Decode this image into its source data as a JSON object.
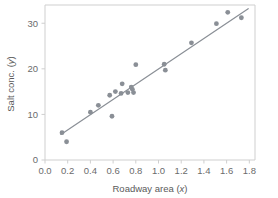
{
  "chart_data": {
    "type": "scatter",
    "title": "",
    "subtitle": "",
    "xlabel": "Roadway area (x)",
    "xlabel_main": "Roadway area",
    "xlabel_var": "x",
    "ylabel": "Salt conc. (y)",
    "ylabel_main": "Salt conc.",
    "ylabel_var": "y",
    "xlim": [
      0.0,
      1.85
    ],
    "ylim": [
      0.0,
      34.0
    ],
    "grid": false,
    "legend": "none",
    "xticks": [
      "0.0",
      "0.2",
      "0.4",
      "0.6",
      "0.8",
      "1.0",
      "1.2",
      "1.4",
      "1.6",
      "1.8"
    ],
    "xtick_values": [
      0.0,
      0.2,
      0.4,
      0.6,
      0.8,
      1.0,
      1.2,
      1.4,
      1.6,
      1.8
    ],
    "yticks": [
      "0",
      "10",
      "20",
      "30"
    ],
    "ytick_values": [
      0,
      10,
      20,
      30
    ],
    "marker": "circle",
    "marker_color": "#8a8f96",
    "marker_size": 2.4,
    "line_color": "#8a8f96",
    "frame_color": "#cfcfcf",
    "text_color": "#6b6b6b",
    "background": "#ffffff",
    "x": [
      0.15,
      0.19,
      0.4,
      0.47,
      0.57,
      0.59,
      0.62,
      0.67,
      0.68,
      0.73,
      0.76,
      0.77,
      0.78,
      0.8,
      1.05,
      1.06,
      1.29,
      1.51,
      1.61,
      1.73
    ],
    "y": [
      6.0,
      4.0,
      10.5,
      12.0,
      14.2,
      9.6,
      15.0,
      14.6,
      16.7,
      14.8,
      16.0,
      15.5,
      14.8,
      20.9,
      21.0,
      19.7,
      25.7,
      29.9,
      32.4,
      31.2
    ],
    "points": [
      {
        "x": 0.15,
        "y": 6.0
      },
      {
        "x": 0.19,
        "y": 4.0
      },
      {
        "x": 0.4,
        "y": 10.5
      },
      {
        "x": 0.47,
        "y": 12.0
      },
      {
        "x": 0.57,
        "y": 14.2
      },
      {
        "x": 0.59,
        "y": 9.6
      },
      {
        "x": 0.62,
        "y": 15.0
      },
      {
        "x": 0.67,
        "y": 14.6
      },
      {
        "x": 0.68,
        "y": 16.7
      },
      {
        "x": 0.73,
        "y": 14.8
      },
      {
        "x": 0.76,
        "y": 16.0
      },
      {
        "x": 0.77,
        "y": 15.5
      },
      {
        "x": 0.78,
        "y": 14.8
      },
      {
        "x": 0.8,
        "y": 20.9
      },
      {
        "x": 1.05,
        "y": 21.0
      },
      {
        "x": 1.06,
        "y": 19.7
      },
      {
        "x": 1.29,
        "y": 25.7
      },
      {
        "x": 1.51,
        "y": 29.9
      },
      {
        "x": 1.61,
        "y": 32.4
      },
      {
        "x": 1.73,
        "y": 31.2
      }
    ],
    "fit_line": {
      "name": "least-squares regression line",
      "x0": 0.14,
      "y0": 5.6,
      "x1": 1.79,
      "y1": 33.2
    }
  }
}
